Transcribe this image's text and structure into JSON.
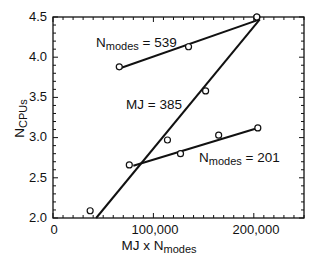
{
  "chart_data": {
    "type": "scatter",
    "title": "",
    "xlabel": "MJ x N_modes",
    "ylabel": "N_CPUs",
    "xlim": [
      0,
      250000
    ],
    "ylim": [
      2.0,
      4.5
    ],
    "grid": false,
    "x_ticks": [
      "0",
      "100,000",
      "200,000"
    ],
    "y_ticks": [
      "2.0",
      "2.5",
      "3.0",
      "3.5",
      "4.0",
      "4.5"
    ],
    "series": [
      {
        "name": "N_modes = 539",
        "points": [
          [
            66000,
            3.88
          ],
          [
            135000,
            4.13
          ],
          [
            203000,
            4.5
          ]
        ],
        "fit_line": [
          [
            66000,
            3.86
          ],
          [
            206000,
            4.47
          ]
        ]
      },
      {
        "name": "MJ = 385",
        "points": [
          [
            37000,
            2.09
          ],
          [
            114000,
            2.97
          ],
          [
            152000,
            3.58
          ],
          [
            203000,
            4.5
          ]
        ],
        "fit_line": [
          [
            43000,
            2.0
          ],
          [
            206000,
            4.47
          ]
        ]
      },
      {
        "name": "N_modes = 201",
        "points": [
          [
            76000,
            2.66
          ],
          [
            127000,
            2.8
          ],
          [
            165000,
            3.03
          ],
          [
            204000,
            3.12
          ]
        ],
        "fit_line": [
          [
            80000,
            2.65
          ],
          [
            204000,
            3.12
          ]
        ]
      }
    ],
    "annotations": [
      {
        "text": "N_modes = 539",
        "near": [
          95000,
          4.25
        ]
      },
      {
        "text": "MJ = 385",
        "near": [
          95000,
          3.45
        ]
      },
      {
        "text": "N_modes = 201",
        "near": [
          190000,
          2.85
        ]
      }
    ]
  },
  "labels": {
    "x_axis_main": "MJ x N",
    "x_axis_sub": "modes",
    "y_axis_main": "N",
    "y_axis_sub": "CPUs",
    "annot_539_main": "N",
    "annot_539_sub": "modes",
    "annot_539_val": " = 539",
    "annot_385": "MJ = 385",
    "annot_201_main": "N",
    "annot_201_sub": "modes",
    "annot_201_val": " = 201",
    "ytick_0": "2.0",
    "ytick_1": "2.5",
    "ytick_2": "3.0",
    "ytick_3": "3.5",
    "ytick_4": "4.0",
    "ytick_5": "4.5",
    "xtick_0": "0",
    "xtick_1": "100,000",
    "xtick_2": "200,000"
  },
  "colors": {
    "ink": "#111111",
    "background": "#ffffff"
  }
}
